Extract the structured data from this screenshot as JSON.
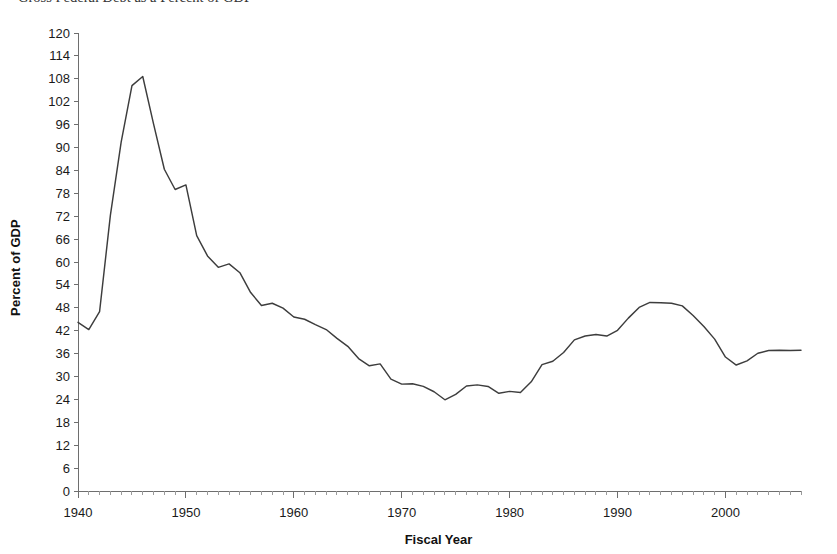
{
  "title_clipped": "Gross Federal Debt as a Percent of GDP",
  "axis": {
    "y_title": "Percent of GDP",
    "x_title": "Fiscal Year",
    "y_ticks": [
      0,
      6,
      12,
      18,
      24,
      30,
      36,
      42,
      48,
      54,
      60,
      66,
      72,
      78,
      84,
      90,
      96,
      102,
      108,
      114,
      120
    ],
    "x_ticks": [
      1940,
      1950,
      1960,
      1970,
      1980,
      1990,
      2000
    ]
  },
  "chart_data": {
    "type": "line",
    "title": "Gross Federal Debt as a Percent of GDP",
    "xlabel": "Fiscal Year",
    "ylabel": "Percent of GDP",
    "xlim": [
      1940,
      2007
    ],
    "ylim": [
      0,
      120
    ],
    "grid": false,
    "legend": "none",
    "series": [
      {
        "name": "Gross Federal Debt",
        "color": "#3d3d3d",
        "x": [
          1940,
          1941,
          1942,
          1943,
          1944,
          1945,
          1946,
          1947,
          1948,
          1949,
          1950,
          1951,
          1952,
          1953,
          1954,
          1955,
          1956,
          1957,
          1958,
          1959,
          1960,
          1961,
          1962,
          1963,
          1964,
          1965,
          1966,
          1967,
          1968,
          1969,
          1970,
          1971,
          1972,
          1973,
          1974,
          1975,
          1976,
          1977,
          1978,
          1979,
          1980,
          1981,
          1982,
          1983,
          1984,
          1985,
          1986,
          1987,
          1988,
          1989,
          1990,
          1991,
          1992,
          1993,
          1994,
          1995,
          1996,
          1997,
          1998,
          1999,
          2000,
          2001,
          2002,
          2003,
          2004,
          2005,
          2006,
          2007
        ],
        "y": [
          44.2,
          42.3,
          47.0,
          72.2,
          91.4,
          106.2,
          108.6,
          96.2,
          84.3,
          79.0,
          80.2,
          66.9,
          61.6,
          58.6,
          59.5,
          57.2,
          52.0,
          48.6,
          49.2,
          47.9,
          45.6,
          45.0,
          43.6,
          42.3,
          40.0,
          37.9,
          34.7,
          32.8,
          33.3,
          29.3,
          28.0,
          28.1,
          27.4,
          26.0,
          23.9,
          25.3,
          27.5,
          27.8,
          27.4,
          25.6,
          26.1,
          25.8,
          28.6,
          33.1,
          34.0,
          36.3,
          39.6,
          40.6,
          41.0,
          40.6,
          42.1,
          45.3,
          48.1,
          49.4,
          49.3,
          49.2,
          48.5,
          46.0,
          43.1,
          39.8,
          35.1,
          33.0,
          34.1,
          36.1,
          36.8,
          36.9,
          36.8,
          36.9
        ]
      }
    ]
  }
}
